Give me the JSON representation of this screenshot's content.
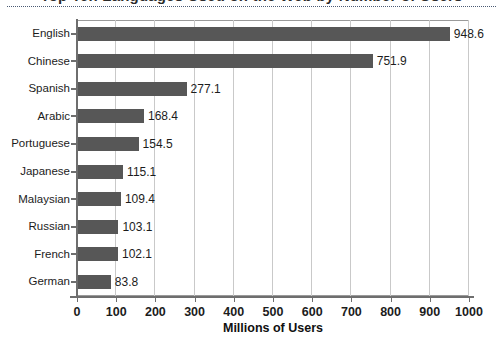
{
  "figure": {
    "title_cut_off": "Top Ten Languages Used on the Web by Number of Users",
    "background_color": "#ffffff"
  },
  "chart_data": {
    "type": "bar",
    "orientation": "horizontal",
    "title": "",
    "xlabel": "Millions of Users",
    "ylabel": "",
    "categories": [
      "English",
      "Chinese",
      "Spanish",
      "Arabic",
      "Portuguese",
      "Japanese",
      "Malaysian",
      "Russian",
      "French",
      "German"
    ],
    "values": [
      948.6,
      751.9,
      277.1,
      168.4,
      154.5,
      115.1,
      109.4,
      103.1,
      102.1,
      83.8
    ],
    "value_labels": [
      "948.6",
      "751.9",
      "277.1",
      "168.4",
      "154.5",
      "115.1",
      "109.4",
      "103.1",
      "102.1",
      "83.8"
    ],
    "xlim": [
      0,
      1000
    ],
    "xticks": [
      0,
      100,
      200,
      300,
      400,
      500,
      600,
      700,
      800,
      900,
      1000
    ],
    "xtick_labels": [
      "0",
      "100",
      "200",
      "300",
      "400",
      "500",
      "600",
      "700",
      "800",
      "900",
      "1000"
    ],
    "grid": "vertical",
    "legend": "none",
    "bar_color": "#575757",
    "gridline_color": "#c9c9c9",
    "axis_color": "#6e6e6e",
    "text_color": "#1c1c1c"
  }
}
